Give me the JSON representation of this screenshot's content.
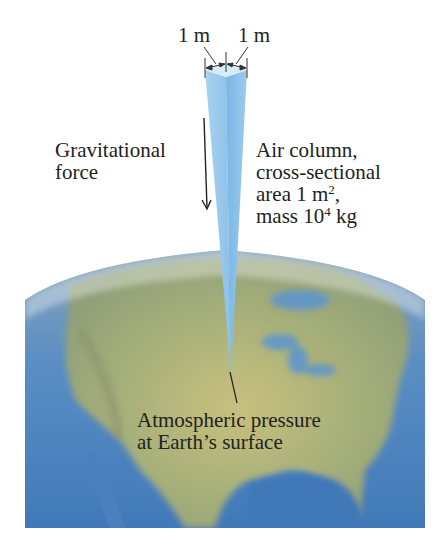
{
  "figure": {
    "dimension_labels": {
      "left": "1 m",
      "right": "1 m"
    },
    "gravity_label": {
      "line1": "Gravitational",
      "line2": "force"
    },
    "column_label": {
      "line1": "Air column,",
      "line2": "cross-sectional",
      "line3_prefix": "area 1 m",
      "line3_sup": "2",
      "line3_suffix": ",",
      "line4_prefix": "mass 10",
      "line4_sup": "4",
      "line4_suffix": " kg"
    },
    "surface_label": {
      "line1": "Atmospheric pressure",
      "line2": "at Earth’s surface"
    },
    "colors": {
      "column_light": "#cfe6f6",
      "column_mid": "#8fc3ea",
      "column_dark": "#6eaee0",
      "ocean": "#4f86c0",
      "land": "#b9b57a",
      "land_green": "#9aa66a",
      "text": "#222222"
    },
    "icons": [
      "down-arrow-icon",
      "dimension-arrow-icon",
      "leader-line-icon"
    ]
  }
}
